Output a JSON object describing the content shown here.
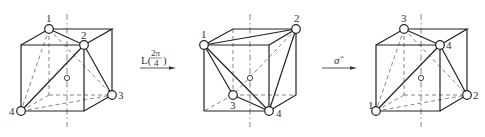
{
  "figure": {
    "cubes": [
      {
        "id": "cube-1",
        "vertex_labels": {
          "v1": "1",
          "v2": "2",
          "v3": "3",
          "v4": "4"
        }
      },
      {
        "id": "cube-2",
        "vertex_labels": {
          "v1": "1",
          "v2": "2",
          "v3": "3",
          "v4": "4"
        }
      },
      {
        "id": "cube-3",
        "vertex_labels": {
          "v1": "1",
          "v2": "2",
          "v3": "3",
          "v4": "4"
        }
      }
    ],
    "operations": [
      {
        "id": "rotation",
        "label_main": "L(",
        "label_num": "2π",
        "label_den": "4",
        "label_close": ")"
      },
      {
        "id": "reflection",
        "label": "σ̂"
      }
    ],
    "colors": {
      "line": "#222222",
      "hidden_line": "#666666",
      "background": "#ffffff"
    }
  }
}
